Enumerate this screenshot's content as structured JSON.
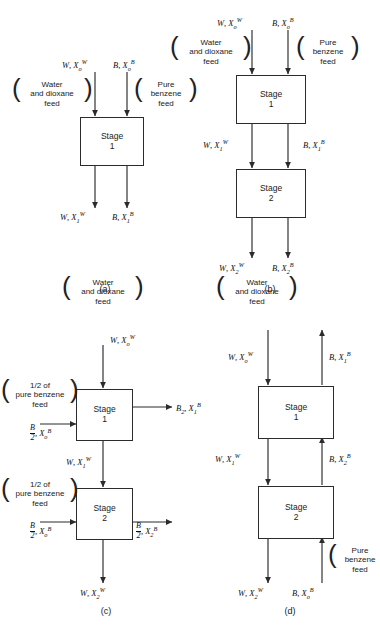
{
  "figure": {
    "panels": [
      {
        "id": "a",
        "caption": "(a)",
        "stages": [
          {
            "name": "Stage",
            "number": "1"
          }
        ],
        "feeds": [
          {
            "name": "water-dioxane-feed",
            "lines": [
              "Water",
              "and dioxane",
              "feed"
            ]
          },
          {
            "name": "pure-benzene-feed",
            "lines": [
              "Pure",
              "benzene",
              "feed"
            ]
          }
        ],
        "streams": {
          "in_water": "W, X_o^W",
          "in_benzene": "B, X_o^B",
          "out_water": "W, X_1^W",
          "out_benzene": "B, X_1^B"
        }
      },
      {
        "id": "b",
        "caption": "(b)",
        "stages": [
          {
            "name": "Stage",
            "number": "1"
          },
          {
            "name": "Stage",
            "number": "2"
          }
        ],
        "feeds": [
          {
            "name": "water-dioxane-feed",
            "lines": [
              "Water",
              "and dioxane",
              "feed"
            ]
          },
          {
            "name": "pure-benzene-feed",
            "lines": [
              "Pure",
              "benzene",
              "feed"
            ]
          }
        ],
        "streams": {
          "in_water": "W, X_o^W",
          "in_benzene": "B, X_o^B",
          "mid_water": "W, X_1^W",
          "mid_benzene": "B, X_1^B",
          "out_water": "W, X_2^W",
          "out_benzene": "B, X_2^B"
        }
      },
      {
        "id": "c",
        "caption": "(c)",
        "stages": [
          {
            "name": "Stage",
            "number": "1"
          },
          {
            "name": "Stage",
            "number": "2"
          }
        ],
        "feeds": [
          {
            "name": "water-dioxane-feed",
            "lines": [
              "Water",
              "and dioxane",
              "feed"
            ]
          },
          {
            "name": "half-benzene-feed-1",
            "lines": [
              "1/2 of",
              "pure benzene",
              "feed"
            ]
          },
          {
            "name": "half-benzene-feed-2",
            "lines": [
              "1/2 of",
              "pure benzene",
              "feed"
            ]
          }
        ],
        "streams": {
          "in_water": "W, X_o^W",
          "in_benzene_1": "B/2, X_o^B",
          "in_benzene_2": "B/2, X_o^B",
          "out_benzene_1": "B_2, X_1^B",
          "mid_water": "W, X_1^W",
          "out_benzene_2": "B/2, X_2^B",
          "out_water": "W, X_2^W"
        }
      },
      {
        "id": "d",
        "caption": "(d)",
        "stages": [
          {
            "name": "Stage",
            "number": "1"
          },
          {
            "name": "Stage",
            "number": "2"
          }
        ],
        "feeds": [
          {
            "name": "water-dioxane-feed",
            "lines": [
              "Water",
              "and dioxane",
              "feed"
            ]
          },
          {
            "name": "pure-benzene-feed",
            "lines": [
              "Pure",
              "benzene",
              "feed"
            ]
          }
        ],
        "streams": {
          "in_water": "W, X_o^W",
          "out_benzene": "B, X_1^B",
          "mid_water": "W, X_1^W",
          "mid_benzene": "B, X_2^B",
          "out_water": "W, X_2^W",
          "in_benzene": "B, X_o^B"
        }
      }
    ]
  },
  "labels": {
    "a": {
      "in_water": {
        "v": "W",
        "sub": "o",
        "sup": "W",
        "lead": "W, X"
      },
      "in_benzene": {
        "lead": "B, X",
        "sub": "o",
        "sup": "B"
      },
      "out_water": {
        "lead": "W, X",
        "sub": "1",
        "sup": "W"
      },
      "out_benzene": {
        "lead": "B, X",
        "sub": "1",
        "sup": "B"
      }
    }
  },
  "text": {
    "stage_word": "Stage",
    "one": "1",
    "two": "2",
    "cap_a": "(a)",
    "cap_b": "(b)",
    "cap_c": "(c)",
    "cap_d": "(d)",
    "water_l1": "Water",
    "water_l2": "and dioxane",
    "water_l3": "feed",
    "benzene_l1": "Pure",
    "benzene_l2": "benzene",
    "benzene_l3": "feed",
    "half_l1": "1/2 of",
    "half_l2": "pure benzene",
    "half_l3": "feed",
    "W": "W",
    "B": "B",
    "X": "X",
    "comma": ", ",
    "sub_o": "o",
    "sub_1": "1",
    "sub_2": "2",
    "sup_W": "W",
    "sup_B": "B"
  },
  "colors": {
    "line": "#2b2b2b",
    "text": "#1a1a1a",
    "background": "#ffffff"
  }
}
